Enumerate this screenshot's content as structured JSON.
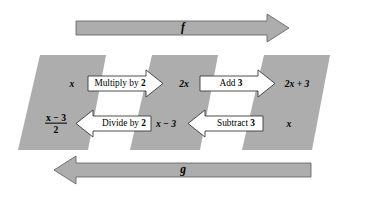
{
  "diagram": {
    "colors": {
      "fill_gray": "#ADADAD",
      "arrow_gray": "#ADADAD",
      "arrow_outline": "#4D4D4D",
      "block_arrow_fill": "#FFFFFF",
      "block_arrow_outline": "#3A3A3A",
      "background": "#FFFFFF",
      "text": "#000000"
    }
  },
  "flow_arrows": {
    "forward": {
      "label": "f",
      "direction": "right",
      "position": "top"
    },
    "backward": {
      "label": "g",
      "direction": "left",
      "position": "bottom"
    }
  },
  "stages": {
    "forward_row": {
      "values": [
        {
          "id": "input",
          "text": "x"
        },
        {
          "id": "after-multiply",
          "text": "2x"
        },
        {
          "id": "after-add",
          "text": "2x + 3"
        }
      ],
      "operations": [
        {
          "id": "multiply-by-2",
          "prefix": "Multiply by ",
          "number": "2",
          "direction": "right"
        },
        {
          "id": "add-3",
          "prefix": "Add ",
          "number": "3",
          "direction": "right"
        }
      ]
    },
    "backward_row": {
      "values": [
        {
          "id": "result",
          "numerator": "x − 3",
          "denominator": "2",
          "is_fraction": true
        },
        {
          "id": "after-subtract",
          "text": "x − 3"
        },
        {
          "id": "reverse-input",
          "text": "x"
        }
      ],
      "operations": [
        {
          "id": "divide-by-2",
          "prefix": "Divide by ",
          "number": "2",
          "direction": "left"
        },
        {
          "id": "subtract-3",
          "prefix": "Subtract ",
          "number": "3",
          "direction": "left"
        }
      ]
    }
  }
}
